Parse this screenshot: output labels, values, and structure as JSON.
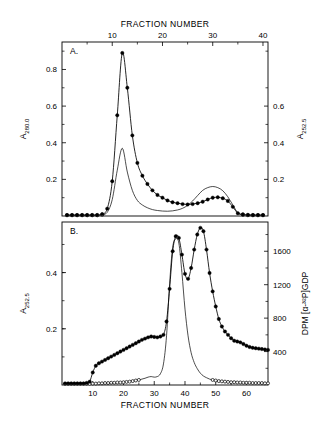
{
  "figure": {
    "title": "",
    "panels": [
      "A.",
      "B."
    ]
  },
  "chart_data": [
    {
      "type": "line",
      "panel": "A.",
      "title": "",
      "xlabel": "FRACTION NUMBER",
      "xlabel_position": "top",
      "ylabel_left": "A",
      "ylabel_left_sub": "280.0",
      "ylabel_right": "A",
      "ylabel_right_sub": "252.5",
      "xlim": [
        0,
        41
      ],
      "ylim_left": [
        0,
        0.95
      ],
      "ylim_right": [
        0,
        0.95
      ],
      "xticks": [
        10,
        20,
        30,
        40
      ],
      "yticks_left": [
        0.2,
        0.4,
        0.6,
        0.8
      ],
      "yticks_right": [
        0.2,
        0.4,
        0.6
      ],
      "grid": false,
      "legend": "none",
      "series": [
        {
          "name": "A280.0",
          "marker": "filled-circle",
          "x": [
            1,
            2,
            3,
            4,
            5,
            6,
            7,
            8,
            9,
            10,
            11,
            12,
            13,
            14,
            15,
            16,
            17,
            18,
            19,
            20,
            21,
            22,
            23,
            24,
            25,
            26,
            27,
            28,
            29,
            30,
            31,
            32,
            33,
            34,
            35,
            36,
            37,
            38,
            39,
            40
          ],
          "values": [
            0.005,
            0.005,
            0.005,
            0.005,
            0.005,
            0.005,
            0.005,
            0.01,
            0.04,
            0.19,
            0.55,
            0.89,
            0.7,
            0.44,
            0.29,
            0.22,
            0.175,
            0.14,
            0.115,
            0.1,
            0.085,
            0.075,
            0.07,
            0.065,
            0.063,
            0.065,
            0.07,
            0.078,
            0.09,
            0.1,
            0.102,
            0.097,
            0.082,
            0.05,
            0.015,
            0.008,
            0.006,
            0.005,
            0.005,
            0.005
          ]
        },
        {
          "name": "A252.5",
          "marker": "open-circle",
          "x": [
            1,
            2,
            3,
            4,
            5,
            6,
            7,
            8,
            9,
            10,
            11,
            12,
            13,
            14,
            15,
            16,
            17,
            18,
            19,
            20,
            21,
            22,
            23,
            24,
            25,
            26,
            27,
            28,
            29,
            30,
            31,
            32,
            33,
            34,
            35,
            36,
            37,
            38,
            39,
            40
          ],
          "values": [
            0.005,
            0.005,
            0.005,
            0.005,
            0.005,
            0.005,
            0.005,
            0.008,
            0.02,
            0.09,
            0.25,
            0.37,
            0.24,
            0.14,
            0.085,
            0.06,
            0.045,
            0.035,
            0.03,
            0.027,
            0.026,
            0.028,
            0.033,
            0.042,
            0.058,
            0.082,
            0.112,
            0.14,
            0.155,
            0.161,
            0.155,
            0.138,
            0.105,
            0.06,
            0.018,
            0.008,
            0.005,
            0.005,
            0.005,
            0.005
          ]
        }
      ]
    },
    {
      "type": "line",
      "panel": "B.",
      "title": "",
      "xlabel": "FRACTION NUMBER",
      "xlabel_position": "bottom",
      "ylabel_left": "A",
      "ylabel_left_sub": "252.5",
      "ylabel_right": "DPM [α-³²P]GDP",
      "xlim": [
        0,
        67
      ],
      "ylim_left": [
        0,
        0.58
      ],
      "ylim_right": [
        0,
        1950
      ],
      "xticks": [
        10,
        20,
        30,
        40,
        50,
        60
      ],
      "yticks_left": [
        0.2,
        0.4
      ],
      "yticks_right": [
        400,
        800,
        1200,
        1600
      ],
      "grid": false,
      "legend": "none",
      "series": [
        {
          "name": "DPM [α-32P]GDP",
          "marker": "filled-circle",
          "axis": "right",
          "x": [
            1,
            2,
            3,
            4,
            5,
            6,
            7,
            8,
            9,
            10,
            11,
            12,
            13,
            14,
            15,
            16,
            17,
            18,
            19,
            20,
            21,
            22,
            23,
            24,
            25,
            26,
            27,
            28,
            29,
            30,
            31,
            32,
            33,
            34,
            35,
            36,
            37,
            38,
            39,
            40,
            41,
            42,
            43,
            44,
            45,
            46,
            47,
            48,
            49,
            50,
            51,
            52,
            53,
            54,
            55,
            56,
            57,
            58,
            59,
            60,
            61,
            62,
            63,
            64,
            65,
            66,
            67
          ],
          "values": [
            20,
            20,
            20,
            20,
            20,
            20,
            20,
            25,
            40,
            150,
            230,
            260,
            280,
            300,
            320,
            340,
            360,
            380,
            400,
            420,
            440,
            460,
            480,
            500,
            520,
            540,
            555,
            570,
            580,
            575,
            570,
            580,
            600,
            760,
            1150,
            1600,
            1780,
            1760,
            1560,
            1330,
            1270,
            1400,
            1620,
            1800,
            1880,
            1840,
            1620,
            1340,
            1120,
            940,
            790,
            700,
            640,
            600,
            560,
            530,
            520,
            510,
            490,
            470,
            455,
            445,
            440,
            435,
            430,
            425,
            420
          ]
        },
        {
          "name": "A252.5",
          "marker": "open-circle",
          "axis": "left",
          "x": [
            1,
            2,
            3,
            4,
            5,
            6,
            7,
            8,
            9,
            10,
            11,
            12,
            13,
            14,
            15,
            16,
            17,
            18,
            19,
            20,
            21,
            22,
            23,
            24,
            25,
            26,
            27,
            28,
            29,
            30,
            31,
            32,
            33,
            34,
            35,
            36,
            37,
            38,
            39,
            40,
            41,
            42,
            43,
            44,
            45,
            46,
            47,
            48,
            49,
            50,
            51,
            52,
            53,
            54,
            55,
            56,
            57,
            58,
            59,
            60,
            61,
            62,
            63,
            64,
            65,
            66,
            67
          ],
          "values": [
            0.004,
            0.004,
            0.004,
            0.004,
            0.004,
            0.004,
            0.004,
            0.004,
            0.004,
            0.005,
            0.005,
            0.006,
            0.006,
            0.007,
            0.007,
            0.008,
            0.008,
            0.009,
            0.009,
            0.01,
            0.011,
            0.012,
            0.014,
            0.016,
            0.018,
            0.021,
            0.024,
            0.028,
            0.03,
            0.028,
            0.03,
            0.04,
            0.075,
            0.175,
            0.36,
            0.49,
            0.52,
            0.505,
            0.4,
            0.27,
            0.175,
            0.115,
            0.08,
            0.058,
            0.042,
            0.032,
            0.026,
            0.021,
            0.018,
            0.016,
            0.014,
            0.013,
            0.012,
            0.011,
            0.01,
            0.01,
            0.009,
            0.009,
            0.008,
            0.008,
            0.008,
            0.007,
            0.007,
            0.007,
            0.007,
            0.006,
            0.006
          ]
        }
      ]
    }
  ]
}
